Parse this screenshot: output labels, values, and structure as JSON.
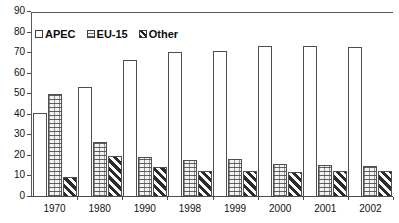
{
  "chart_data": {
    "type": "bar",
    "title": "",
    "subtitle": "",
    "xlabel": "",
    "ylabel": "",
    "ylim": [
      0,
      90
    ],
    "ytick_step": 10,
    "yticks": [
      "90",
      "80",
      "70",
      "60",
      "50",
      "40",
      "30",
      "20",
      "10",
      "0"
    ],
    "grid": false,
    "legend_position": "top-left",
    "categories": [
      "1970",
      "1980",
      "1990",
      "1998",
      "1999",
      "2000",
      "2001",
      "2002"
    ],
    "series": [
      {
        "name": "APEC",
        "pattern": "solid-white",
        "values": [
          41,
          53.5,
          66.5,
          70.5,
          71,
          73.5,
          73.5,
          73
        ]
      },
      {
        "name": "EU-15",
        "pattern": "brick-hatch",
        "values": [
          50,
          27,
          19.5,
          18,
          18.5,
          16,
          15.5,
          15
        ]
      },
      {
        "name": "Other",
        "pattern": "diagonal-hatch",
        "values": [
          9.5,
          20,
          14.5,
          12.5,
          12.5,
          12,
          12.5,
          12.5
        ]
      }
    ]
  },
  "colors": {
    "axis": "#4a4a4a",
    "text": "#111111",
    "bar_outline": "#4f4f4f",
    "background": "#ffffff"
  }
}
